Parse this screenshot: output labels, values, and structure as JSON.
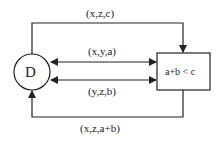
{
  "diagram": {
    "node_d": {
      "label": "D",
      "shape": "circle"
    },
    "node_box": {
      "label": "a+b < c",
      "shape": "rectangle"
    },
    "edges": [
      {
        "id": "top",
        "label": "(x,z,c)",
        "from": "D",
        "to": "a+b < c",
        "direction": "to-box"
      },
      {
        "id": "upper",
        "label": "(x,y,a)",
        "from": "D",
        "to": "a+b < c",
        "direction": "bidirectional"
      },
      {
        "id": "lower",
        "label": "(y,z,b)",
        "from": "D",
        "to": "a+b < c",
        "direction": "bidirectional"
      },
      {
        "id": "bottom",
        "label": "(x,z,a+b)",
        "from": "a+b < c",
        "to": "D",
        "direction": "to-circle"
      }
    ],
    "colors": {
      "stroke": "#222222",
      "background": "#ffffff"
    }
  }
}
